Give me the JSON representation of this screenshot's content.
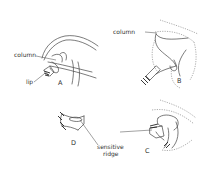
{
  "figure": {
    "panels": [
      {
        "id": "A",
        "label": "A"
      },
      {
        "id": "B",
        "label": "B"
      },
      {
        "id": "C",
        "label": "C"
      },
      {
        "id": "D",
        "label": "D"
      }
    ],
    "labels": {
      "column_a": "column",
      "lip_a": "lip",
      "column_b": "column",
      "sensitive_1": "sensitive",
      "sensitive_2": "ridge"
    },
    "colors": {
      "line": "#444444",
      "background": "#ffffff"
    }
  }
}
